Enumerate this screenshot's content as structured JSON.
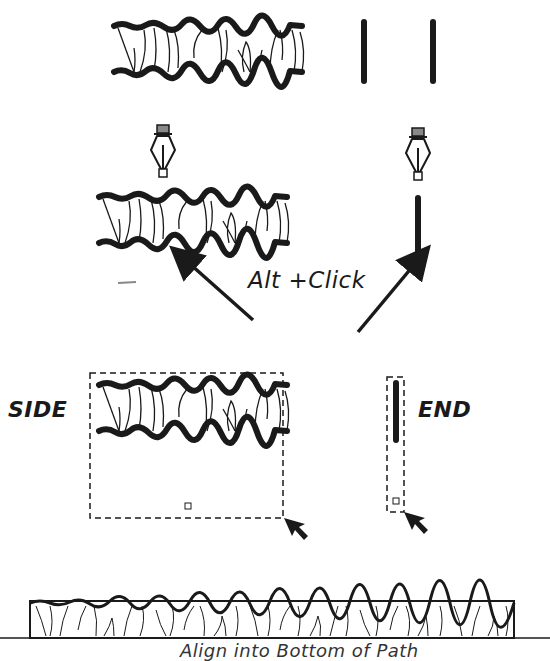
{
  "labels": {
    "alt_click": "Alt +Click",
    "side": "SIDE",
    "end": "END",
    "caption": "Align into Bottom of Path"
  },
  "colors": {
    "ink": "#1a1a1a",
    "pen_cap": "#888888",
    "background": "#ffffff"
  },
  "panels": [
    {
      "id": "top-brush-stroke",
      "kind": "grass-brush-side"
    },
    {
      "id": "top-end-strokes",
      "kind": "vertical-bars",
      "count": 2
    },
    {
      "id": "pen-on-brush",
      "kind": "pen-tool-over-brush"
    },
    {
      "id": "pen-on-bar",
      "kind": "pen-tool-over-bar"
    },
    {
      "id": "side-tile",
      "kind": "pattern-tile",
      "label": "SIDE"
    },
    {
      "id": "end-tile",
      "kind": "pattern-tile",
      "label": "END"
    },
    {
      "id": "result-border",
      "kind": "pattern-brush-applied"
    }
  ],
  "icons": [
    "pen-tool-icon",
    "pen-tool-icon",
    "arrow-icon",
    "arrow-icon",
    "cursor-arrow-icon",
    "cursor-arrow-icon"
  ]
}
